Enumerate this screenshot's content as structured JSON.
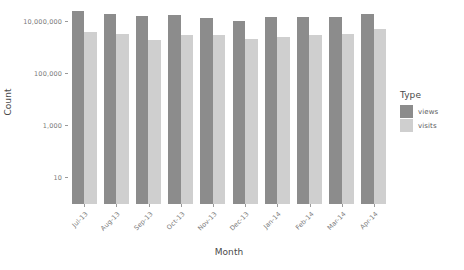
{
  "chart_data": {
    "type": "bar",
    "title": "",
    "subtitle": "",
    "xlabel": "Month",
    "ylabel": "Count",
    "yscale": "log",
    "grid": false,
    "legend_position": "right",
    "legend_title": "Type",
    "categories": [
      "Jul-13",
      "Aug-13",
      "Sep-13",
      "Oct-13",
      "Nov-13",
      "Dec-13",
      "Jan-14",
      "Feb-14",
      "Mar-14",
      "Apr-14"
    ],
    "y_tick_labels": [
      "10,000,000",
      "100,000",
      "1,000",
      "10"
    ],
    "y_tick_values": [
      10000000,
      100000,
      1000,
      10
    ],
    "ylim": [
      1,
      40000000
    ],
    "series": [
      {
        "name": "views",
        "color": "#8c8c8c",
        "values": [
          25000000,
          19000000,
          17000000,
          18500000,
          14000000,
          11000000,
          14500000,
          15500000,
          15000000,
          20000000
        ]
      },
      {
        "name": "visits",
        "color": "#cfcfcf",
        "values": [
          4000000,
          3300000,
          2000000,
          3000000,
          3100000,
          2200000,
          2700000,
          3100000,
          3300000,
          5200000
        ]
      }
    ]
  },
  "axes": {
    "y_title": "Count",
    "x_title": "Month",
    "y_ticks": [
      {
        "label": "10,000,000",
        "pos_pct": 11.3
      },
      {
        "label": "100,000",
        "pos_pct": 30.4
      },
      {
        "label": "1,000",
        "pos_pct": 60.0
      },
      {
        "label": "10",
        "pos_pct": 90.0
      }
    ]
  },
  "legend": {
    "title": "Type",
    "items": [
      {
        "label": "views",
        "color": "#8c8c8c"
      },
      {
        "label": "visits",
        "color": "#cfcfcf"
      }
    ]
  }
}
